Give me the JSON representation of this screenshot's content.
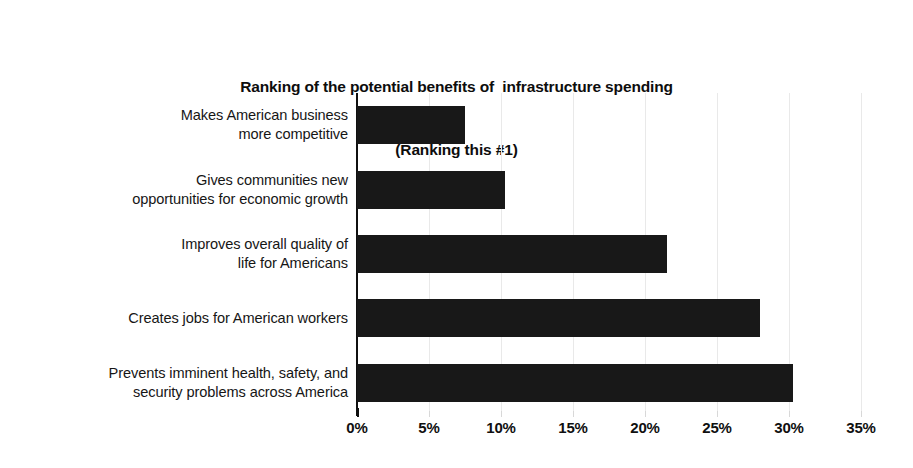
{
  "chart_data": {
    "type": "bar",
    "orientation": "horizontal",
    "title": "Ranking of the potential benefits of  infrastructure spending\n(Ranking this #1)",
    "title_line1": "Ranking of the potential benefits of  infrastructure spending",
    "title_line2": "(Ranking this #1)",
    "subtitle": "(Ranking this #1)",
    "xlabel": "",
    "ylabel": "",
    "categories": [
      "Makes American business more competitive",
      "Gives communities new opportunities for economic growth",
      "Improves overall quality of life for Americans",
      "Creates jobs for American workers",
      "Prevents imminent health, safety, and security problems across America"
    ],
    "category_lines": [
      [
        "Makes American business",
        "more competitive"
      ],
      [
        "Gives communities new",
        "opportunities for economic growth"
      ],
      [
        "Improves overall quality of",
        "life for Americans"
      ],
      [
        "Creates jobs for American workers"
      ],
      [
        "Prevents imminent health, safety, and",
        "security problems across America"
      ]
    ],
    "values": [
      7.5,
      10.3,
      21.5,
      28.0,
      30.3
    ],
    "value_labels": [
      "7.5%",
      "10.3%",
      "21.5%",
      "28.0%",
      "30.3%"
    ],
    "xlim": [
      0,
      35
    ],
    "xticks": [
      0,
      5,
      10,
      15,
      20,
      25,
      30,
      35
    ],
    "xtick_labels": [
      "0%",
      "5%",
      "10%",
      "15%",
      "20%",
      "25%",
      "30%",
      "35%"
    ],
    "grid": true,
    "grid_axis": "x",
    "legend": false,
    "legend_position": "none",
    "bar_color": "#181818",
    "background_color": "#ffffff",
    "axis_color": "#101010",
    "gridline_color": "#e9e9e9"
  }
}
